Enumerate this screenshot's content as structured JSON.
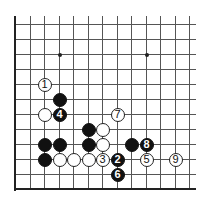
{
  "board": {
    "grid": {
      "columns": 13,
      "rows": 12,
      "origin_x": 15,
      "origin_y": 24,
      "col_spacing": 14.5,
      "row_spacing": 15,
      "top_y": 16,
      "right_x": 196,
      "edges": [
        "left",
        "bottom"
      ]
    },
    "star_points": [
      {
        "c": 3,
        "r": 2
      },
      {
        "c": 9,
        "r": 2
      }
    ],
    "stones": [
      {
        "color": "white",
        "c": 2,
        "r": 4,
        "label": "1"
      },
      {
        "color": "black",
        "c": 3,
        "r": 5,
        "label": ""
      },
      {
        "color": "white",
        "c": 2,
        "r": 6,
        "label": ""
      },
      {
        "color": "black",
        "c": 3,
        "r": 6,
        "label": "4"
      },
      {
        "color": "white",
        "c": 7,
        "r": 6,
        "label": "7"
      },
      {
        "color": "black",
        "c": 5,
        "r": 7,
        "label": ""
      },
      {
        "color": "white",
        "c": 6,
        "r": 7,
        "label": ""
      },
      {
        "color": "black",
        "c": 2,
        "r": 8,
        "label": ""
      },
      {
        "color": "black",
        "c": 3,
        "r": 8,
        "label": ""
      },
      {
        "color": "black",
        "c": 5,
        "r": 8,
        "label": ""
      },
      {
        "color": "white",
        "c": 6,
        "r": 8,
        "label": ""
      },
      {
        "color": "black",
        "c": 8,
        "r": 8,
        "label": ""
      },
      {
        "color": "black",
        "c": 9,
        "r": 8,
        "label": "8"
      },
      {
        "color": "black",
        "c": 2,
        "r": 9,
        "label": ""
      },
      {
        "color": "white",
        "c": 3,
        "r": 9,
        "label": ""
      },
      {
        "color": "white",
        "c": 4,
        "r": 9,
        "label": ""
      },
      {
        "color": "white",
        "c": 5,
        "r": 9,
        "label": ""
      },
      {
        "color": "white",
        "c": 6,
        "r": 9,
        "label": "3"
      },
      {
        "color": "black",
        "c": 7,
        "r": 9,
        "label": "2"
      },
      {
        "color": "white",
        "c": 9,
        "r": 9,
        "label": "5"
      },
      {
        "color": "white",
        "c": 11,
        "r": 9,
        "label": "9"
      },
      {
        "color": "black",
        "c": 7,
        "r": 10,
        "label": "6"
      }
    ]
  }
}
